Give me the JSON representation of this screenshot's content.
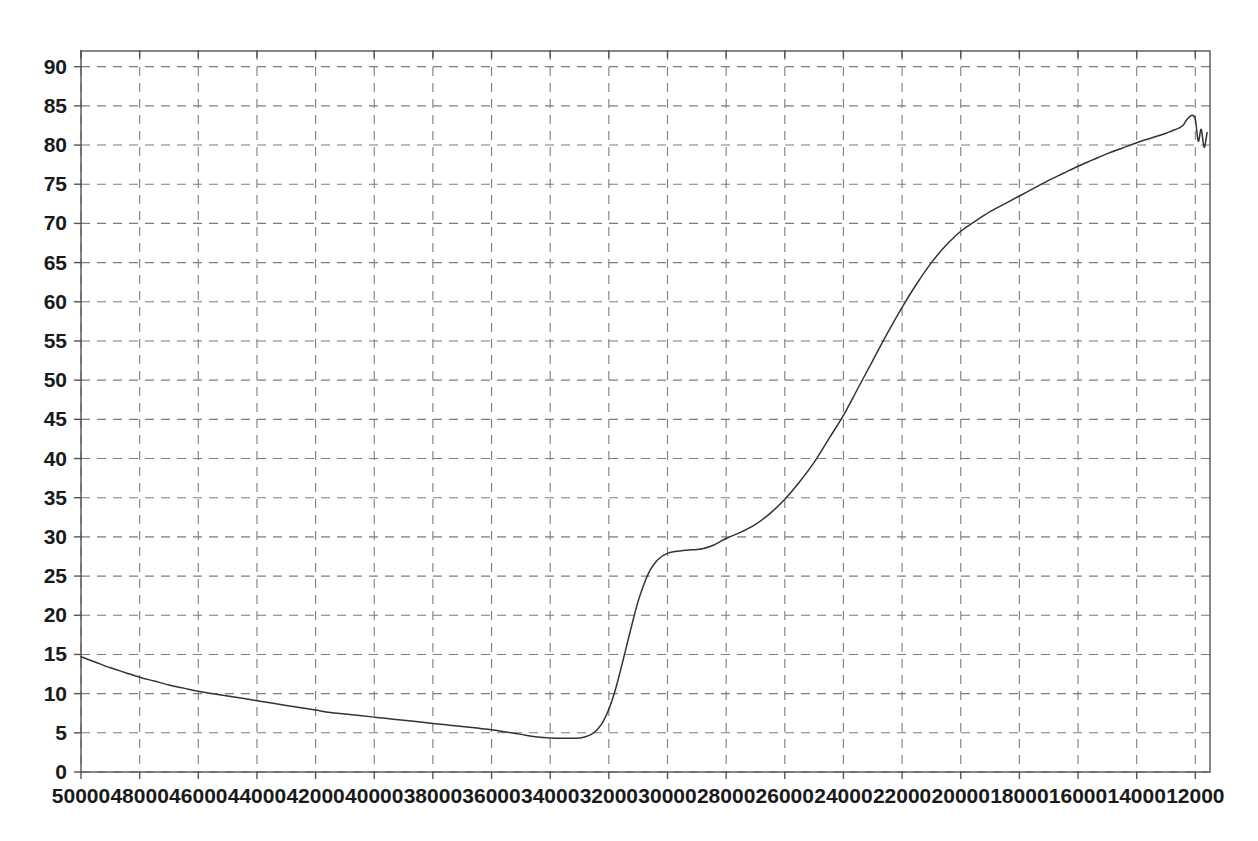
{
  "chart_data": {
    "type": "line",
    "title": "",
    "subtitle": "",
    "xlabel": "",
    "ylabel": "",
    "xlim": [
      50000,
      11500
    ],
    "ylim": [
      0,
      92
    ],
    "x_axis_reversed": true,
    "grid": true,
    "grid_style": "dashed",
    "legend": "none",
    "x_ticks": [
      50000,
      48000,
      46000,
      44000,
      42000,
      40000,
      38000,
      36000,
      34000,
      32000,
      30000,
      28000,
      26000,
      24000,
      22000,
      20000,
      18000,
      16000,
      14000,
      12000
    ],
    "x_tick_labels": [
      "50000",
      "48000",
      "46000",
      "44000",
      "42000",
      "40000",
      "38000",
      "36000",
      "34000",
      "32000",
      "30000",
      "28000",
      "26000",
      "24000",
      "22000",
      "20000",
      "18000",
      "16000",
      "14000",
      "12000"
    ],
    "y_ticks": [
      0,
      5,
      10,
      15,
      20,
      25,
      30,
      35,
      40,
      45,
      50,
      55,
      60,
      65,
      70,
      75,
      80,
      85,
      90
    ],
    "y_tick_labels": [
      "0",
      "5",
      "10",
      "15",
      "20",
      "25",
      "30",
      "35",
      "40",
      "45",
      "50",
      "55",
      "60",
      "65",
      "70",
      "75",
      "80",
      "85",
      "90"
    ],
    "line_color": "#333333",
    "grid_color": "#7d7d7d",
    "frame_color": "#555555",
    "series": [
      {
        "name": "transmittance",
        "x": [
          50000,
          49500,
          49000,
          48500,
          48000,
          47500,
          47000,
          46500,
          46000,
          45500,
          45000,
          44500,
          44000,
          43500,
          43000,
          42500,
          42000,
          41500,
          41000,
          40500,
          40000,
          39500,
          39000,
          38500,
          38000,
          37500,
          37000,
          36500,
          36000,
          35500,
          35000,
          34500,
          34000,
          33800,
          33600,
          33400,
          33200,
          33000,
          32800,
          32600,
          32400,
          32200,
          32000,
          31800,
          31600,
          31400,
          31200,
          31000,
          30800,
          30600,
          30400,
          30200,
          30000,
          29800,
          29600,
          29400,
          29200,
          29000,
          28800,
          28600,
          28400,
          28200,
          28000,
          27500,
          27000,
          26500,
          26000,
          25500,
          25000,
          24500,
          24000,
          23500,
          23000,
          22500,
          22000,
          21500,
          21000,
          20500,
          20000,
          19500,
          19000,
          18500,
          18000,
          17500,
          17000,
          16500,
          16000,
          15500,
          15000,
          14500,
          14000,
          13500,
          13000,
          12800,
          12600,
          12500,
          12400,
          12300,
          12200,
          12100,
          12000,
          11900,
          11800,
          11700,
          11600
        ],
        "y": [
          14.7,
          14.0,
          13.3,
          12.7,
          12.1,
          11.6,
          11.1,
          10.7,
          10.3,
          10.0,
          9.7,
          9.4,
          9.1,
          8.8,
          8.5,
          8.2,
          7.9,
          7.6,
          7.4,
          7.2,
          7.0,
          6.8,
          6.6,
          6.4,
          6.2,
          6.0,
          5.8,
          5.6,
          5.4,
          5.1,
          4.8,
          4.5,
          4.35,
          4.3,
          4.3,
          4.3,
          4.3,
          4.35,
          4.5,
          4.8,
          5.4,
          6.4,
          8.0,
          10.2,
          13.0,
          16.0,
          19.0,
          21.8,
          24.0,
          25.7,
          26.8,
          27.5,
          27.9,
          28.1,
          28.2,
          28.3,
          28.35,
          28.4,
          28.5,
          28.7,
          29.0,
          29.4,
          29.8,
          30.6,
          31.6,
          33.0,
          34.8,
          37.0,
          39.5,
          42.5,
          45.5,
          49.0,
          52.5,
          56.0,
          59.3,
          62.3,
          65.0,
          67.2,
          69.0,
          70.3,
          71.5,
          72.5,
          73.5,
          74.5,
          75.5,
          76.4,
          77.3,
          78.1,
          78.9,
          79.6,
          80.3,
          80.9,
          81.5,
          81.8,
          82.1,
          82.3,
          82.6,
          83.2,
          83.6,
          83.8,
          83.3,
          80.5,
          82.0,
          79.7,
          81.6
        ],
        "noise_region_start": 12400,
        "noise_amplitude": 2.0
      }
    ],
    "notes": {
      "baseline_min_value": 4.3,
      "baseline_min_x_range": [
        35000,
        33200
      ],
      "shoulder_plateau_value": 28.3,
      "shoulder_plateau_x_range": [
        29800,
        28600
      ],
      "max_value": 83.8,
      "start_value": 14.7
    }
  },
  "plot_geometry": {
    "left": 81,
    "top": 51,
    "right": 1210,
    "bottom": 772
  }
}
